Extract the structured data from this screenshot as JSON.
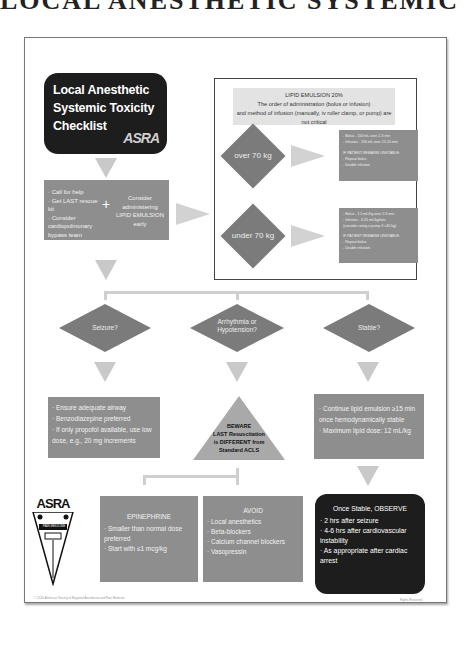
{
  "page": {
    "title": "LOCAL ANESTHETIC SYSTEMIC TOXICITY"
  },
  "checklist": {
    "title_lines": [
      "Local Anesthetic",
      "Systemic Toxicity",
      "Checklist"
    ],
    "logo": "ASRA"
  },
  "first_steps": {
    "bullets": [
      "Call for help",
      "Get LAST rescue kit",
      "Consider cardiopulmonary bypass team"
    ],
    "plus": "+",
    "consider": "Consider administering LIPID EMULSION early"
  },
  "lipid": {
    "title": "LIPID EMULSION 20%",
    "line1": "The order of administration (bolus or infusion)",
    "line2": "and method of infusion (manually, iv roller clamp, or pump) are not critical",
    "over": {
      "label": "over 70 kg",
      "lines": [
        "- Bolus - 100 mL over 2-3 min",
        "- Infusion - 250 mL over 15-20 min",
        "",
        "IF PATIENT REMAINS UNSTABLE:",
        "- Repeat bolus",
        "- Double infusion"
      ]
    },
    "under": {
      "label": "under 70 kg",
      "lines": [
        "- Bolus - 1.5 mL/kg over 2-3 min",
        "- Infusion - 0.25 mL/kg/min",
        "  (consider using a pump if <40 kg)",
        "",
        "IF PATIENT REMAINS UNSTABLE:",
        "- Repeat bolus",
        "- Double infusion"
      ]
    }
  },
  "decisions": [
    {
      "label": "Seizure?"
    },
    {
      "label": "Arrhythmia or Hypotension?"
    },
    {
      "label": "Stable?"
    }
  ],
  "seizure_box": {
    "bullets": [
      "Ensure adequate airway",
      "Benzodiazepine preferred",
      "If only propofol available, use low dose, e.g., 20 mg increments"
    ]
  },
  "beware": {
    "lines": [
      "BEWARE",
      "LAST Resuscitation",
      "is DIFFERENT from",
      "Standard ACLS"
    ]
  },
  "stable_box": {
    "bullets": [
      "Continue lipid emulsion ≥15 min once hemodynamically stable",
      "Maximum lipid dose: 12 mL/kg"
    ]
  },
  "epinephrine": {
    "title": "EPINEPHRINE",
    "bullets": [
      "Smaller than normal dose preferred",
      "Start with ≤1 mcg/kg"
    ]
  },
  "avoid": {
    "title": "AVOID",
    "bullets": [
      "Local anesthetics",
      "Beta-blockers",
      "Calcium channel blockers",
      "Vasopressin"
    ]
  },
  "observe": {
    "title": "Once Stable, OBSERVE",
    "bullets": [
      "2 hrs after seizure",
      "4-6 hrs after cardiovascular instability",
      "As appropriate after cardiac arrest"
    ]
  },
  "asra_logo": {
    "text": "ASRA",
    "band": "PAIN MEDICINE"
  },
  "footer": {
    "left": "© 2020 American Society of Regional Anesthesia and Pain Medicine",
    "right": "Rights Reserved"
  },
  "colors": {
    "dark_box": "#1d1d1d",
    "gray_box": "#8e8e8e",
    "arrow": "#c9c9c9",
    "diamond": "#7b7b7b"
  }
}
